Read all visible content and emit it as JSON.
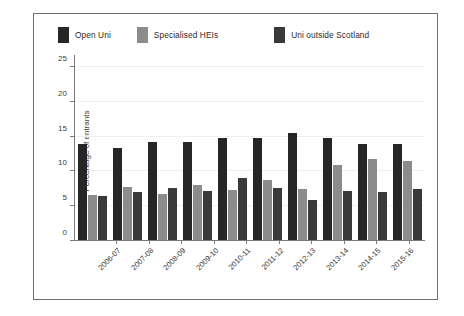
{
  "chart_data": {
    "type": "bar",
    "title": "",
    "xlabel": "",
    "ylabel": "Percentage of entrants",
    "ylim": [
      0,
      26
    ],
    "yticks": [
      0,
      5,
      10,
      15,
      20,
      25
    ],
    "grid": true,
    "legend_position": "top",
    "categories": [
      "2006-07",
      "2007-08",
      "2008-09",
      "2009-10",
      "2010-11",
      "2011-12",
      "2012-13",
      "2013-14",
      "2014-15",
      "2015-16"
    ],
    "series": [
      {
        "name": "Open Uni",
        "color": "#262626",
        "values": [
          13.8,
          13.3,
          14.1,
          14.1,
          14.8,
          14.8,
          15.4,
          14.8,
          13.9,
          13.8
        ]
      },
      {
        "name": "Specialised HEIs",
        "color": "#8c8c8c",
        "values": [
          6.5,
          7.6,
          6.7,
          7.9,
          7.2,
          8.6,
          7.4,
          10.8,
          11.7,
          11.4
        ]
      },
      {
        "name": "Uni outside Scotland",
        "color": "#3a3a3a",
        "values": [
          6.3,
          7.0,
          7.5,
          7.1,
          9.0,
          7.5,
          5.8,
          7.1,
          7.0,
          7.4
        ]
      }
    ]
  },
  "caption": {
    "text": ""
  }
}
